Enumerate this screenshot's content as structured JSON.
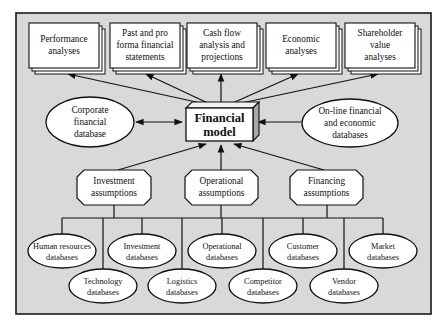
{
  "diagram": {
    "title": "Financial model",
    "center": {
      "line1": "Financial",
      "line2": "model"
    },
    "outputs": [
      {
        "id": "performance",
        "lines": [
          "Performance",
          "analyses"
        ]
      },
      {
        "id": "past-pro-forma",
        "lines": [
          "Past and pro",
          "forma financial",
          "statements"
        ]
      },
      {
        "id": "cash-flow",
        "lines": [
          "Cash flow",
          "analysis and",
          "projections"
        ]
      },
      {
        "id": "economic",
        "lines": [
          "Economic",
          "analyses"
        ]
      },
      {
        "id": "shareholder-value",
        "lines": [
          "Shareholder",
          "value",
          "analyses"
        ]
      }
    ],
    "side_databases": [
      {
        "id": "corporate-financial",
        "lines": [
          "Corporate",
          "financial",
          "database"
        ],
        "connection": "bidirectional"
      },
      {
        "id": "online-financial-economic",
        "lines": [
          "On-line financial",
          "and economic",
          "databases"
        ],
        "connection": "input"
      }
    ],
    "assumptions": [
      {
        "id": "investment",
        "lines": [
          "Investment",
          "assumptions"
        ]
      },
      {
        "id": "operational",
        "lines": [
          "Operational",
          "assumptions"
        ]
      },
      {
        "id": "financing",
        "lines": [
          "Financing",
          "assumptions"
        ]
      }
    ],
    "source_databases": [
      {
        "id": "human-resources",
        "lines": [
          "Human resources",
          "databases"
        ]
      },
      {
        "id": "investment-db",
        "lines": [
          "Investment",
          "databases"
        ]
      },
      {
        "id": "operational-db",
        "lines": [
          "Operational",
          "databases"
        ]
      },
      {
        "id": "customer",
        "lines": [
          "Customer",
          "databases"
        ]
      },
      {
        "id": "market",
        "lines": [
          "Market",
          "databases"
        ]
      },
      {
        "id": "technology",
        "lines": [
          "Technology",
          "databases"
        ]
      },
      {
        "id": "logistics",
        "lines": [
          "Logistics",
          "databases"
        ]
      },
      {
        "id": "competitor",
        "lines": [
          "Competitor",
          "databases"
        ]
      },
      {
        "id": "vendor",
        "lines": [
          "Vendor",
          "databases"
        ]
      }
    ],
    "colors": {
      "panel_background": "#d9d9d9",
      "shape_fill": "#ffffff",
      "stroke": "#111111",
      "cube_side": "#a9a9a9"
    }
  }
}
